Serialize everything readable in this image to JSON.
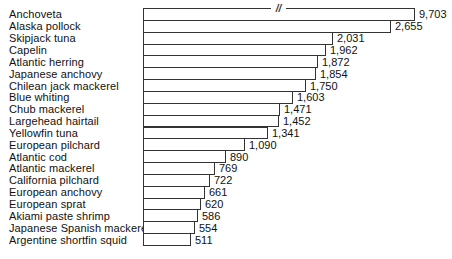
{
  "chart_data": {
    "type": "bar",
    "orientation": "horizontal",
    "title": "",
    "xlabel": "",
    "ylabel": "",
    "grid": false,
    "legend": false,
    "bar_fill": "#ffffff",
    "bar_border": "#333333",
    "text_color": "#111111",
    "categories": [
      "Anchoveta",
      "Alaska pollock",
      "Skipjack tuna",
      "Capelin",
      "Atlantic herring",
      "Japanese anchovy",
      "Chilean jack mackerel",
      "Blue whiting",
      "Chub mackerel",
      "Largehead hairtail",
      "Yellowfin tuna",
      "European pilchard",
      "Atlantic cod",
      "Atlantic mackerel",
      "California pilchard",
      "European anchovy",
      "European sprat",
      "Akiami paste shrimp",
      "Japanese Spanish mackerel",
      "Argentine shortfin squid"
    ],
    "values": [
      9703,
      2655,
      2031,
      1962,
      1872,
      1854,
      1750,
      1603,
      1471,
      1452,
      1341,
      1090,
      890,
      769,
      722,
      661,
      620,
      586,
      554,
      511
    ],
    "value_labels": [
      "9,703",
      "2,655",
      "2,031",
      "1,962",
      "1,872",
      "1,854",
      "1,750",
      "1,603",
      "1,471",
      "1,452",
      "1,341",
      "1,090",
      "890",
      "769",
      "722",
      "661",
      "620",
      "586",
      "554",
      "511"
    ],
    "axis_break": {
      "category": "Anchoveta",
      "symbol": "//",
      "note": "first bar is truncated; break symbol shown on bar outline"
    }
  }
}
